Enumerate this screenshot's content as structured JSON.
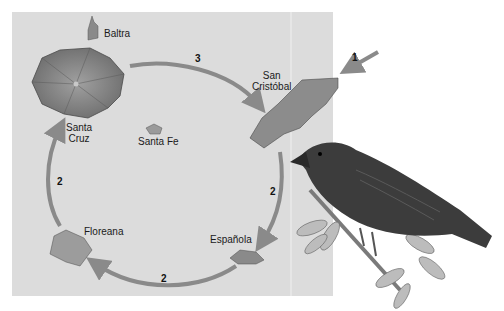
{
  "islands": [
    {
      "id": "baltra",
      "label": "Baltra"
    },
    {
      "id": "santa-cruz",
      "label_line1": "Santa",
      "label_line2": "Cruz"
    },
    {
      "id": "santa-fe",
      "label": "Santa Fe"
    },
    {
      "id": "san-cristobal",
      "label_line1": "San",
      "label_line2": "Cristóbal"
    },
    {
      "id": "espanola",
      "label": "Española"
    },
    {
      "id": "floreana",
      "label": "Floreana"
    }
  ],
  "arrows": [
    {
      "id": "arrival",
      "number": "1",
      "from": "mainland",
      "to": "San Cristóbal"
    },
    {
      "id": "cristobal-to-espanola",
      "number": "2",
      "from": "San Cristóbal",
      "to": "Española"
    },
    {
      "id": "espanola-to-floreana",
      "number": "2",
      "from": "Española",
      "to": "Floreana"
    },
    {
      "id": "floreana-to-santacruz",
      "number": "2",
      "from": "Floreana",
      "to": "Santa Cruz"
    },
    {
      "id": "santacruz-to-cristobal",
      "number": "3",
      "from": "Santa Cruz",
      "to": "San Cristóbal"
    }
  ],
  "colors": {
    "panel": "#dcdcdc",
    "arrow": "#8a8a8a",
    "island": "#7a7a7a",
    "bird": "#3a3a3a"
  }
}
